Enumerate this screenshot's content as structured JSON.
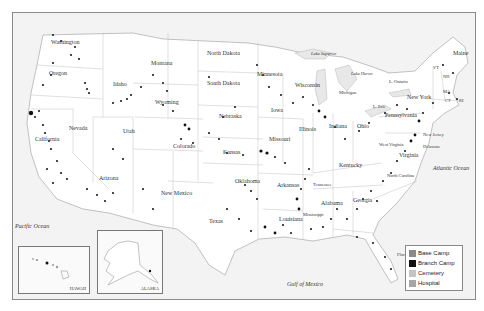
{
  "map": {
    "title": "",
    "states": [
      {
        "name": "Washington",
        "x": 38,
        "y": 38
      },
      {
        "name": "Oregon",
        "x": 36,
        "y": 69
      },
      {
        "name": "Idaho",
        "x": 100,
        "y": 80
      },
      {
        "name": "Montana",
        "x": 145,
        "y": 59
      },
      {
        "name": "Wyoming",
        "x": 147,
        "y": 98
      },
      {
        "name": "Nevada",
        "x": 56,
        "y": 124
      },
      {
        "name": "Utah",
        "x": 110,
        "y": 127
      },
      {
        "name": "California",
        "x": 26,
        "y": 135
      },
      {
        "name": "Colorado",
        "x": 164,
        "y": 142
      },
      {
        "name": "Arizona",
        "x": 90,
        "y": 174
      },
      {
        "name": "New Mexico",
        "x": 150,
        "y": 189
      },
      {
        "name": "North Dakota",
        "x": 194,
        "y": 49
      },
      {
        "name": "South Dakota",
        "x": 194,
        "y": 79
      },
      {
        "name": "Nebraska",
        "x": 203,
        "y": 112
      },
      {
        "name": "Kansas",
        "x": 208,
        "y": 148
      },
      {
        "name": "Oklahoma",
        "x": 222,
        "y": 177
      },
      {
        "name": "Texas",
        "x": 198,
        "y": 217
      },
      {
        "name": "Minnesota",
        "x": 249,
        "y": 70
      },
      {
        "name": "Iowa",
        "x": 255,
        "y": 106
      },
      {
        "name": "Missouri",
        "x": 259,
        "y": 135
      },
      {
        "name": "Arkansas",
        "x": 264,
        "y": 181
      },
      {
        "name": "Louisiana",
        "x": 268,
        "y": 215
      },
      {
        "name": "Wisconsin",
        "x": 283,
        "y": 81
      },
      {
        "name": "Illinois",
        "x": 286,
        "y": 125
      },
      {
        "name": "Michigan",
        "x": 325,
        "y": 90
      },
      {
        "name": "Indiana",
        "x": 314,
        "y": 122
      },
      {
        "name": "Ohio",
        "x": 345,
        "y": 121
      },
      {
        "name": "Kentucky",
        "x": 330,
        "y": 161
      },
      {
        "name": "Tennessee",
        "x": 306,
        "y": 180
      },
      {
        "name": "Mississippi",
        "x": 292,
        "y": 210
      },
      {
        "name": "Alabama",
        "x": 309,
        "y": 199
      },
      {
        "name": "Georgia",
        "x": 340,
        "y": 196
      },
      {
        "name": "Florida",
        "x": 391,
        "y": 251
      },
      {
        "name": "North Carolina",
        "x": 385,
        "y": 172
      },
      {
        "name": "Virginia",
        "x": 387,
        "y": 151
      },
      {
        "name": "West Virginia",
        "x": 373,
        "y": 140
      },
      {
        "name": "Pennsylvania",
        "x": 385,
        "y": 110
      },
      {
        "name": "New York",
        "x": 400,
        "y": 93
      },
      {
        "name": "New Jersey",
        "x": 412,
        "y": 130
      },
      {
        "name": "Delaware",
        "x": 412,
        "y": 146
      },
      {
        "name": "Maine",
        "x": 450,
        "y": 49
      },
      {
        "name": "VT",
        "x": 426,
        "y": 65
      },
      {
        "name": "NH",
        "x": 436,
        "y": 73
      },
      {
        "name": "MA",
        "x": 436,
        "y": 89
      },
      {
        "name": "CT",
        "x": 437,
        "y": 97
      },
      {
        "name": "RI",
        "x": 449,
        "y": 97
      }
    ],
    "water": [
      {
        "name": "Pacific Ocean",
        "x": 6,
        "y": 221
      },
      {
        "name": "Atlantic Ocean",
        "x": 431,
        "y": 164
      },
      {
        "name": "Gulf of Mexico",
        "x": 278,
        "y": 280
      },
      {
        "name": "Lake Superior",
        "x": 301,
        "y": 51
      },
      {
        "name": "Lake Huron",
        "x": 344,
        "y": 70
      },
      {
        "name": "L. Ontario",
        "x": 380,
        "y": 79
      },
      {
        "name": "L. Erie",
        "x": 366,
        "y": 104
      }
    ],
    "insets": {
      "hawaii": {
        "label": "HAWAII"
      },
      "alaska": {
        "label": "ALASKA"
      }
    }
  },
  "legend": {
    "items": [
      {
        "label": "Base Camp",
        "color": "#8a8a8a"
      },
      {
        "label": "Branch Camp",
        "color": "#111111"
      },
      {
        "label": "Cemetery",
        "color": "#c4c4c4"
      },
      {
        "label": "Hospital",
        "color": "#a6a6a6"
      }
    ]
  }
}
